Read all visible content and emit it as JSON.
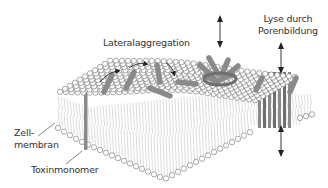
{
  "diagram": {
    "labels": {
      "lateral_aggregation": "Lateralaggregation",
      "lysis_line1": "Lyse durch",
      "lysis_line2": "Porenbildung",
      "cell_membrane_line1": "Zell-",
      "cell_membrane_line2": "membran",
      "toxin_monomer": "Toxinmonomer"
    },
    "colors": {
      "lipid_head_fill": "#ffffff",
      "lipid_head_stroke": "#6e6e6e",
      "lipid_tail": "#b8b8b8",
      "toxin": "#8a8a8a",
      "toxin_dark": "#6f6f6f",
      "arrow": "#222222",
      "text": "#333333",
      "leader_line": "#555555"
    },
    "stages": [
      "Toxinmonomer",
      "Lateralaggregation",
      "Porenbildung",
      "Lyse"
    ]
  }
}
